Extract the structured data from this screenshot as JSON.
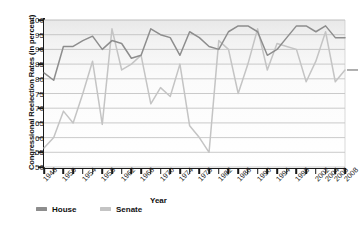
{
  "chart_data": {
    "type": "line",
    "title": "",
    "xlabel": "Year",
    "ylabel": "Congressional Reelection Rates (in percent)",
    "ylim": [
      50,
      100
    ],
    "ytick_values": [
      50,
      55,
      60,
      65,
      70,
      75,
      80,
      85,
      90,
      95,
      100
    ],
    "grid": "horizontal",
    "legend_position": "bottom-left",
    "x": [
      1946,
      1948,
      1950,
      1952,
      1954,
      1956,
      1958,
      1960,
      1962,
      1964,
      1966,
      1968,
      1970,
      1972,
      1974,
      1976,
      1978,
      1980,
      1982,
      1984,
      1986,
      1988,
      1990,
      1992,
      1994,
      1996,
      1998,
      2000,
      2002,
      2004,
      2006,
      2008
    ],
    "xtick_labels": [
      "1946",
      "1950",
      "1954",
      "1958",
      "1962",
      "1966",
      "1970",
      "1974",
      "1978",
      "1982",
      "1986",
      "1990",
      "1994",
      "1998",
      "2002",
      "2004",
      "2006",
      "2008"
    ],
    "series": [
      {
        "name": "House",
        "color": "#8d8d8d",
        "values": [
          82,
          79.5,
          91,
          91,
          93,
          94.5,
          90,
          93,
          92,
          87,
          88,
          97,
          95,
          94,
          88,
          96,
          94,
          91,
          90,
          96,
          98,
          98,
          96,
          88,
          90,
          94,
          98,
          98,
          96,
          98,
          94,
          94
        ]
      },
      {
        "name": "Senate",
        "color": "#c4c4c4",
        "values": [
          56.5,
          60,
          69,
          65,
          75,
          86,
          64.5,
          97,
          83,
          85,
          88,
          71.5,
          77,
          74,
          85,
          64,
          60,
          55,
          93,
          90,
          75,
          85,
          97,
          83,
          92,
          91,
          90,
          79,
          86,
          96,
          79,
          83
        ]
      }
    ],
    "annotations": {
      "right_edge_marker": "83"
    }
  },
  "legend": {
    "items": [
      {
        "label": "House"
      },
      {
        "label": "Senate"
      }
    ]
  }
}
